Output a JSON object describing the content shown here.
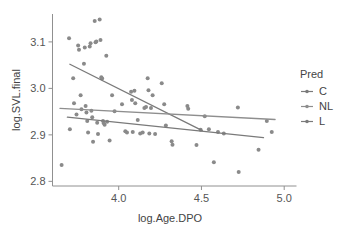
{
  "chart_data": {
    "type": "scatter",
    "title": "",
    "xlabel": "log.Age.DPO",
    "ylabel": "log.SVL.final",
    "xlim": [
      3.6,
      5.02
    ],
    "ylim": [
      2.79,
      3.16
    ],
    "xticks": [
      "4.0",
      "4.5",
      "5.0"
    ],
    "xtick_values": [
      4.0,
      4.5,
      5.0
    ],
    "yticks": [
      "2.8",
      "2.9",
      "3.0",
      "3.1"
    ],
    "ytick_values": [
      2.8,
      2.9,
      3.0,
      3.1
    ],
    "grid": false,
    "legend": {
      "title": "Pred",
      "position": "right",
      "entries": [
        {
          "label": "C",
          "color": "#7a7a7a"
        },
        {
          "label": "NL",
          "color": "#8e8e8e"
        },
        {
          "label": "L",
          "color": "#7a7a7a"
        }
      ]
    },
    "point_color": "#8a8a8a",
    "point_radius": 2.0,
    "points": [
      {
        "x": 3.655,
        "y": 2.835
      },
      {
        "x": 3.7,
        "y": 3.108
      },
      {
        "x": 3.705,
        "y": 2.912
      },
      {
        "x": 3.725,
        "y": 3.022
      },
      {
        "x": 3.73,
        "y": 2.968
      },
      {
        "x": 3.745,
        "y": 2.944
      },
      {
        "x": 3.755,
        "y": 3.092
      },
      {
        "x": 3.76,
        "y": 3.083
      },
      {
        "x": 3.77,
        "y": 2.985
      },
      {
        "x": 3.775,
        "y": 2.955
      },
      {
        "x": 3.79,
        "y": 3.053
      },
      {
        "x": 3.795,
        "y": 3.088
      },
      {
        "x": 3.8,
        "y": 2.962
      },
      {
        "x": 3.805,
        "y": 2.948
      },
      {
        "x": 3.81,
        "y": 2.93
      },
      {
        "x": 3.815,
        "y": 2.905
      },
      {
        "x": 3.825,
        "y": 3.09
      },
      {
        "x": 3.83,
        "y": 3.097
      },
      {
        "x": 3.835,
        "y": 2.952
      },
      {
        "x": 3.84,
        "y": 2.938
      },
      {
        "x": 3.845,
        "y": 2.885
      },
      {
        "x": 3.855,
        "y": 3.145
      },
      {
        "x": 3.86,
        "y": 3.099
      },
      {
        "x": 3.865,
        "y": 3.101
      },
      {
        "x": 3.87,
        "y": 2.926
      },
      {
        "x": 3.875,
        "y": 2.902
      },
      {
        "x": 3.885,
        "y": 3.148
      },
      {
        "x": 3.89,
        "y": 3.104
      },
      {
        "x": 3.895,
        "y": 3.024
      },
      {
        "x": 3.9,
        "y": 3.021
      },
      {
        "x": 3.905,
        "y": 2.93
      },
      {
        "x": 3.91,
        "y": 2.925
      },
      {
        "x": 3.915,
        "y": 2.922
      },
      {
        "x": 3.925,
        "y": 3.07
      },
      {
        "x": 3.93,
        "y": 2.928
      },
      {
        "x": 3.945,
        "y": 2.888
      },
      {
        "x": 3.96,
        "y": 2.985
      },
      {
        "x": 3.975,
        "y": 2.951
      },
      {
        "x": 4.02,
        "y": 2.966
      },
      {
        "x": 4.04,
        "y": 2.908
      },
      {
        "x": 4.05,
        "y": 2.905
      },
      {
        "x": 4.075,
        "y": 2.993
      },
      {
        "x": 4.08,
        "y": 2.975
      },
      {
        "x": 4.085,
        "y": 2.906
      },
      {
        "x": 4.095,
        "y": 2.995
      },
      {
        "x": 4.1,
        "y": 2.968
      },
      {
        "x": 4.115,
        "y": 2.932
      },
      {
        "x": 4.13,
        "y": 2.903
      },
      {
        "x": 4.145,
        "y": 2.905
      },
      {
        "x": 4.155,
        "y": 2.958
      },
      {
        "x": 4.165,
        "y": 2.96
      },
      {
        "x": 4.175,
        "y": 3.022
      },
      {
        "x": 4.18,
        "y": 2.996
      },
      {
        "x": 4.185,
        "y": 2.903
      },
      {
        "x": 4.195,
        "y": 2.958
      },
      {
        "x": 4.205,
        "y": 2.985
      },
      {
        "x": 4.22,
        "y": 2.902
      },
      {
        "x": 4.26,
        "y": 3.011
      },
      {
        "x": 4.275,
        "y": 2.966
      },
      {
        "x": 4.285,
        "y": 2.92
      },
      {
        "x": 4.32,
        "y": 2.886
      },
      {
        "x": 4.325,
        "y": 2.879
      },
      {
        "x": 4.415,
        "y": 2.962
      },
      {
        "x": 4.42,
        "y": 2.956
      },
      {
        "x": 4.47,
        "y": 2.878
      },
      {
        "x": 4.495,
        "y": 2.911
      },
      {
        "x": 4.52,
        "y": 2.94
      },
      {
        "x": 4.545,
        "y": 2.912
      },
      {
        "x": 4.575,
        "y": 2.841
      },
      {
        "x": 4.6,
        "y": 2.906
      },
      {
        "x": 4.635,
        "y": 2.903
      },
      {
        "x": 4.72,
        "y": 2.959
      },
      {
        "x": 4.725,
        "y": 2.82
      },
      {
        "x": 4.845,
        "y": 2.868
      },
      {
        "x": 4.895,
        "y": 2.93
      },
      {
        "x": 4.925,
        "y": 2.906
      }
    ],
    "series": [
      {
        "name": "C",
        "type": "line",
        "color": "#7a7a7a",
        "x_start": 3.705,
        "y_start": 3.052,
        "x_end": 4.505,
        "y_end": 2.909
      },
      {
        "name": "NL",
        "type": "line",
        "color": "#8e8e8e",
        "x_start": 3.645,
        "y_start": 2.957,
        "x_end": 4.945,
        "y_end": 2.933
      },
      {
        "name": "L",
        "type": "line",
        "color": "#7a7a7a",
        "x_start": 3.69,
        "y_start": 2.938,
        "x_end": 4.875,
        "y_end": 2.894
      }
    ]
  }
}
